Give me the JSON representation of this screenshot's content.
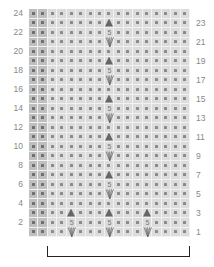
{
  "chart": {
    "rows": 24,
    "columns": 17,
    "edge_columns": 2,
    "colors": {
      "background": "#dcdcdc",
      "edge_background": "#bfbfbf",
      "dot": "#8a8a8a",
      "symbol": "#666666",
      "gridline": "#f2f2f2",
      "bracket": "#222222"
    },
    "left_labels": [
      "24",
      "22",
      "20",
      "18",
      "16",
      "14",
      "12",
      "10",
      "8",
      "6",
      "4",
      "2"
    ],
    "right_labels": [
      "23",
      "21",
      "19",
      "17",
      "15",
      "13",
      "11",
      "9",
      "7",
      "5",
      "3",
      "1"
    ],
    "symbol_number": "5",
    "legend": {
      "dot": "purl-or-knit-stitch",
      "triangle": "bobble-or-decrease",
      "five_v": "5-into-1 / make 5 stitches"
    },
    "symbol_placements": {
      "rows_1_to_4_columns": [
        4,
        8,
        12
      ],
      "rows_5_to_24_columns": [
        8
      ],
      "triangle_rows": [
        3,
        7,
        11,
        15,
        19,
        23
      ],
      "v_rows": [
        1,
        5,
        9,
        13,
        17,
        21
      ]
    },
    "repeat_bracket": {
      "from_column": 2,
      "to_column": 16,
      "label": ""
    }
  }
}
